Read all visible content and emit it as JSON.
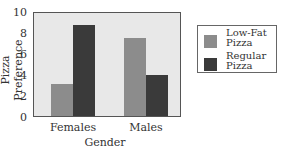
{
  "chart_data": {
    "type": "bar",
    "title": "",
    "xlabel": "Gender",
    "ylabel": "Pizza Preference",
    "categories": [
      "Females",
      "Males"
    ],
    "series": [
      {
        "name": "Low-Fat Pizza",
        "values": [
          3.1,
          7.6
        ],
        "color": "#8c8c8c"
      },
      {
        "name": "Regular Pizza",
        "values": [
          8.8,
          4.0
        ],
        "color": "#3a3a3a"
      }
    ],
    "ylim": [
      0,
      10
    ],
    "yticks": [
      0,
      2,
      4,
      6,
      8,
      10
    ],
    "grid": false,
    "legend_position": "right"
  },
  "legend": {
    "items": [
      {
        "label_line1": "Low-Fat",
        "label_line2": "Pizza"
      },
      {
        "label_line1": "Regular",
        "label_line2": "Pizza"
      }
    ]
  }
}
